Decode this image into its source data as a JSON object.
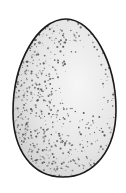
{
  "image": {
    "subject": "speckled egg illustration",
    "background": "#ffffff",
    "egg": {
      "fill": "#eeeeee",
      "outline": "#1a1a1a",
      "speckle_color": "#555555"
    }
  }
}
